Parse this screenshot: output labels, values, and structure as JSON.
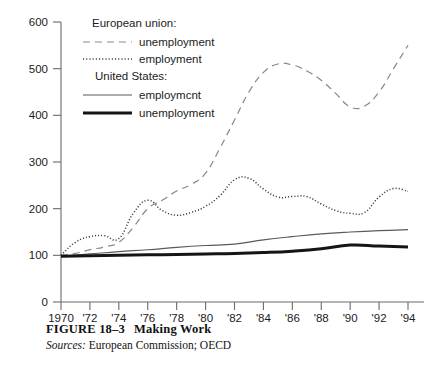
{
  "figure": {
    "number_label": "FIGURE 18–3",
    "title": "Making Work",
    "sources_label": "Sources:",
    "sources_text": "European Commission; OECD"
  },
  "legend": {
    "group_eu_heading": "European union:",
    "group_us_heading": "United States:",
    "eu_unemployment_label": "unemployment",
    "eu_employment_label": "employment",
    "us_employment_label": "employmcnt",
    "us_unemployment_label": "unemployment"
  },
  "colors": {
    "axis": "#6b6b6b",
    "eu_unemployment": "#8a8a8a",
    "eu_employment": "#3c3c3c",
    "us_employment": "#5a5a5a",
    "us_unemployment": "#151515",
    "text": "#1b1b1b",
    "background": "#ffffff"
  },
  "chart_data": {
    "type": "line",
    "title": "Making Work",
    "xlabel": "",
    "ylabel": "",
    "xlim": [
      1970,
      1994
    ],
    "ylim": [
      0,
      600
    ],
    "ytick_values": [
      0,
      100,
      200,
      300,
      400,
      500,
      600
    ],
    "ytick_labels": [
      "0",
      "100",
      "200",
      "300",
      "400",
      "500",
      "600"
    ],
    "xtick_values": [
      1970,
      1972,
      1974,
      1976,
      1978,
      1980,
      1982,
      1984,
      1986,
      1988,
      1990,
      1992,
      1994
    ],
    "xtick_labels": [
      "1970",
      "'72",
      "'74",
      "'76",
      "'78",
      "'80",
      "'82",
      "'84",
      "'86",
      "'88",
      "'90",
      "'92",
      "'94"
    ],
    "grid": false,
    "legend_position": "upper-left-inside",
    "note": "index values, 1970 = 100",
    "series": [
      {
        "name": "European union: unemployment",
        "style": "dashed",
        "x": [
          1970,
          1971,
          1972,
          1973,
          1974,
          1975,
          1976,
          1977,
          1978,
          1979,
          1980,
          1981,
          1982,
          1983,
          1984,
          1985,
          1986,
          1987,
          1988,
          1989,
          1990,
          1991,
          1992,
          1993,
          1994
        ],
        "values": [
          100,
          104,
          112,
          118,
          128,
          160,
          200,
          218,
          238,
          252,
          276,
          330,
          390,
          450,
          492,
          510,
          508,
          495,
          475,
          447,
          418,
          420,
          450,
          500,
          550
        ]
      },
      {
        "name": "European union: employment",
        "style": "dotted",
        "x": [
          1970,
          1971,
          1972,
          1973,
          1974,
          1975,
          1976,
          1977,
          1978,
          1979,
          1980,
          1981,
          1982,
          1983,
          1984,
          1985,
          1986,
          1987,
          1988,
          1989,
          1990,
          1991,
          1992,
          1993,
          1994
        ],
        "values": [
          100,
          128,
          140,
          142,
          136,
          190,
          218,
          196,
          186,
          192,
          205,
          228,
          262,
          265,
          242,
          225,
          226,
          226,
          210,
          196,
          190,
          192,
          225,
          243,
          237
        ]
      },
      {
        "name": "United States: employment",
        "style": "solid-thin",
        "x": [
          1970,
          1972,
          1974,
          1976,
          1978,
          1980,
          1982,
          1984,
          1986,
          1988,
          1990,
          1992,
          1994
        ],
        "values": [
          98,
          103,
          108,
          112,
          117,
          121,
          124,
          133,
          140,
          146,
          150,
          153,
          155
        ]
      },
      {
        "name": "United States: unemployment",
        "style": "solid-thick",
        "x": [
          1970,
          1972,
          1974,
          1976,
          1978,
          1980,
          1982,
          1984,
          1986,
          1988,
          1990,
          1992,
          1994
        ],
        "values": [
          98,
          99,
          100,
          101,
          102,
          103,
          104,
          106,
          109,
          114,
          122,
          120,
          118
        ]
      }
    ]
  }
}
